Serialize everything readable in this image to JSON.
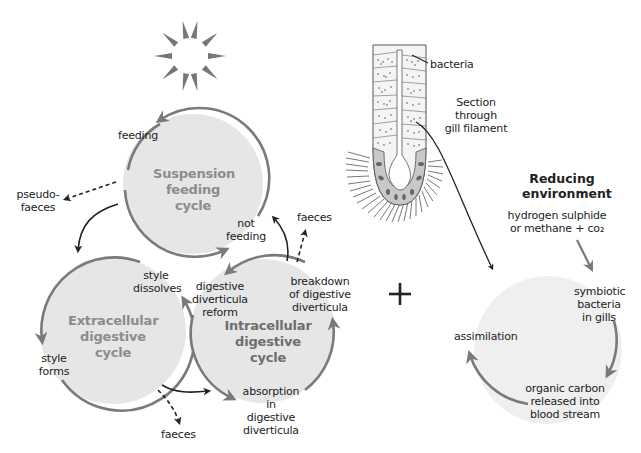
{
  "colors": {
    "circle_fill": "#e6e6e6",
    "circle_fill_light": "#efefef",
    "arc_stroke": "#7a7a7a",
    "arrow_black": "#222222",
    "cycle_title": "#8c8c8c",
    "cycle_title_dark": "#6e6e6e"
  },
  "suspension_cycle": {
    "title": "Suspension\nfeeding\ncycle",
    "feeding_label": "feeding",
    "not_feeding_label": "not\nfeeding",
    "pseudofaeces_label": "pseudo-\nfaeces"
  },
  "extracellular_cycle": {
    "title": "Extracellular\ndigestive\ncycle",
    "style_dissolves_label": "style\ndissolves",
    "style_forms_label": "style\nforms",
    "faeces_label": "faeces"
  },
  "intracellular_cycle": {
    "title": "Intracellular\ndigestive\ncycle",
    "reform_label": "digestive\ndiverticula\nreform",
    "breakdown_label": "breakdown\nof digestive\ndiverticula",
    "absorption_label": "absorption\nin digestive\ndiverticula",
    "faeces_label": "faeces"
  },
  "plus_sign": "+",
  "gill_section": {
    "bacteria_label": "bacteria",
    "section_label": "Section through\ngill filament"
  },
  "symbiotic_cycle": {
    "header": "Reducing\nenvironment",
    "input_label": "hydrogen sulphide\nor methane + co₂",
    "symbiotic_label": "symbiotic\nbacteria\nin gills",
    "organic_carbon_label": "organic carbon\nreleased into\nblood stream",
    "assimilation_label": "assimilation"
  },
  "icons": {
    "sun": "sun-icon"
  }
}
